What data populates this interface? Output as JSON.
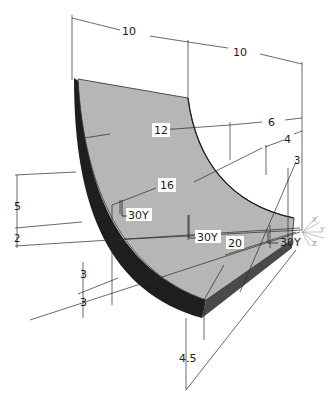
{
  "figure": {
    "colors": {
      "face": "#b4b4b4",
      "dark_side": "#1e1e1e",
      "mid_side": "#5a5a5a",
      "line": "#2a2a2a"
    },
    "dimensions": {
      "top_left": "10",
      "top_right": "10",
      "d12": "12",
      "d6": "6",
      "d4": "4",
      "d3_right": "3",
      "d16": "16",
      "d5": "5",
      "d2": "2",
      "d3_a": "3",
      "d3_b": "3",
      "d20": "20",
      "d4_5": "4.5"
    },
    "annotations": {
      "label_30y_upper": "30Y",
      "label_30y_center": "30Y",
      "label_30y_right": "30Y"
    },
    "axis_triad": {
      "labels": [
        "X",
        "Y",
        "Z"
      ]
    }
  }
}
